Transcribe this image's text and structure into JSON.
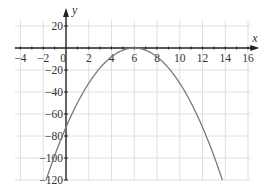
{
  "chart_data": {
    "type": "line",
    "title": "",
    "xlabel": "x",
    "ylabel": "y",
    "xlim": [
      -4.5,
      16
    ],
    "ylim": [
      -120,
      25
    ],
    "grid": true,
    "legend": null,
    "x_ticks": [
      -4,
      -2,
      0,
      2,
      4,
      6,
      8,
      10,
      12,
      14,
      16
    ],
    "x_tick_labels": [
      "−4",
      "−2",
      "0",
      "2",
      "4",
      "6",
      "8",
      "10",
      "12",
      "14",
      "16"
    ],
    "y_ticks": [
      20,
      -20,
      -40,
      -60,
      -80,
      -100,
      -120
    ],
    "y_tick_labels": [
      "20",
      "−20",
      "−40",
      "−60",
      "−80",
      "−100",
      "−120"
    ],
    "series": [
      {
        "name": "parabola",
        "equation": "y = -2(x - 6)^2",
        "color": "#7a7a7a",
        "x": [
          -1.75,
          -1,
          0,
          1,
          2,
          3,
          4,
          5,
          6,
          7,
          8,
          9,
          10,
          11,
          12,
          13,
          13.75
        ],
        "y": [
          -120.1,
          -98,
          -72,
          -50,
          -32,
          -18,
          -8,
          -2,
          0,
          -2,
          -8,
          -18,
          -32,
          -50,
          -72,
          -98,
          -120.1
        ]
      }
    ]
  },
  "colors": {
    "axis": "#222222",
    "grid": "#d8d8d8",
    "curve": "#7a7a7a",
    "text": "#333333"
  }
}
